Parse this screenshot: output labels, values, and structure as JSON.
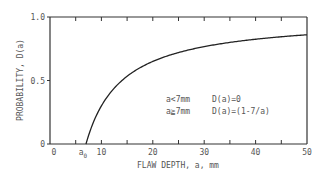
{
  "chart_data": {
    "type": "line",
    "title": "",
    "xlabel": "FLAW DEPTH, a, mm",
    "ylabel": "PROBABILITY, D(a)",
    "xlim": [
      0,
      50
    ],
    "ylim": [
      0,
      1.0
    ],
    "x_ticks": [
      0,
      5,
      10,
      15,
      20,
      25,
      30,
      35,
      40,
      45,
      50
    ],
    "x_tick_labels": [
      {
        "value": 0,
        "label": "0"
      },
      {
        "value": 10,
        "label": "10"
      },
      {
        "value": 20,
        "label": "20"
      },
      {
        "value": 30,
        "label": "30"
      },
      {
        "value": 40,
        "label": "40"
      },
      {
        "value": 50,
        "label": "50"
      }
    ],
    "special_x_label": {
      "value": 7,
      "label": "a",
      "subscript": "0"
    },
    "y_tick_labels": [
      {
        "value": 0,
        "label": "0"
      },
      {
        "value": 0.5,
        "label": "0.5"
      },
      {
        "value": 1.0,
        "label": "1.0"
      }
    ],
    "grid": false,
    "series": [
      {
        "name": "D(a)",
        "formula": "D(a)=1-7/a for a>=7; 0 otherwise",
        "x": [
          7,
          8,
          9,
          10,
          12,
          14,
          16,
          18,
          20,
          25,
          30,
          35,
          40,
          45,
          50
        ],
        "y": [
          0,
          0.125,
          0.222,
          0.3,
          0.417,
          0.5,
          0.5625,
          0.611,
          0.65,
          0.72,
          0.767,
          0.8,
          0.825,
          0.844,
          0.86
        ]
      }
    ],
    "annotations": [
      {
        "cond": "a<7mm",
        "expr": "D(a)=0"
      },
      {
        "cond": "a≧7mm",
        "expr": "D(a)=(1-7/a)"
      }
    ]
  }
}
